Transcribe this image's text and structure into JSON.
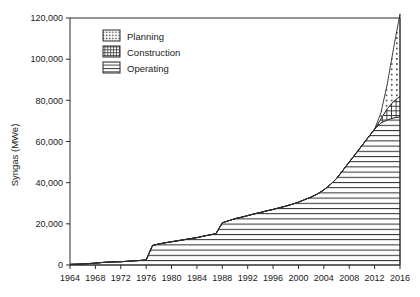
{
  "chart_data": {
    "type": "area",
    "title": "",
    "xlabel": "",
    "ylabel": "Syngas (MWe)",
    "xlim": [
      1964,
      2016
    ],
    "ylim": [
      0,
      120000
    ],
    "grid": false,
    "legend_position": "top-left",
    "y_ticks": [
      0,
      20000,
      40000,
      60000,
      80000,
      100000,
      120000
    ],
    "y_tick_labels": [
      "0",
      "20,000",
      "40,000",
      "60,000",
      "80,000",
      "100,000",
      "120,000"
    ],
    "x_ticks": [
      1964,
      1968,
      1972,
      1976,
      1980,
      1984,
      1988,
      1992,
      1996,
      2000,
      2004,
      2008,
      2012,
      2016
    ],
    "x_tick_labels": [
      "1964",
      "1968",
      "1972",
      "1976",
      "1980",
      "1984",
      "1988",
      "1992",
      "1996",
      "2000",
      "2004",
      "2008",
      "2012",
      "2016"
    ],
    "legend": [
      {
        "name": "Planning",
        "pattern": "dots"
      },
      {
        "name": "Construction",
        "pattern": "grid"
      },
      {
        "name": "Operating",
        "pattern": "horizontal-lines"
      }
    ],
    "x": [
      1964,
      1965,
      1966,
      1967,
      1968,
      1969,
      1970,
      1971,
      1972,
      1973,
      1974,
      1975,
      1976,
      1977,
      1978,
      1979,
      1980,
      1981,
      1982,
      1983,
      1984,
      1985,
      1986,
      1987,
      1988,
      1989,
      1990,
      1991,
      1992,
      1993,
      1994,
      1995,
      1996,
      1997,
      1998,
      1999,
      2000,
      2001,
      2002,
      2003,
      2004,
      2005,
      2006,
      2007,
      2008,
      2009,
      2010,
      2011,
      2012,
      2013,
      2014,
      2015,
      2016
    ],
    "series": [
      {
        "name": "Operating",
        "pattern": "horizontal-lines",
        "values": [
          300,
          400,
          500,
          700,
          900,
          1200,
          1400,
          1500,
          1600,
          1800,
          2000,
          2200,
          2400,
          9500,
          10200,
          10800,
          11300,
          11800,
          12300,
          12800,
          13300,
          14000,
          14600,
          15200,
          20500,
          21500,
          22500,
          23200,
          24000,
          24800,
          25500,
          26300,
          27000,
          27800,
          28600,
          29500,
          30500,
          31800,
          33000,
          34500,
          36500,
          39000,
          42000,
          46000,
          50000,
          54000,
          58000,
          62000,
          66000,
          69000,
          70500,
          71500,
          72000
        ]
      },
      {
        "name": "Construction",
        "pattern": "grid",
        "values": [
          0,
          0,
          0,
          0,
          0,
          0,
          0,
          0,
          0,
          0,
          0,
          0,
          0,
          0,
          0,
          0,
          0,
          0,
          0,
          0,
          0,
          0,
          0,
          0,
          0,
          0,
          0,
          0,
          0,
          0,
          0,
          0,
          0,
          0,
          0,
          0,
          0,
          0,
          0,
          0,
          0,
          0,
          0,
          0,
          0,
          0,
          0,
          0,
          0,
          2000,
          5500,
          8000,
          10000
        ]
      },
      {
        "name": "Planning",
        "pattern": "dots",
        "values": [
          0,
          0,
          0,
          0,
          0,
          0,
          0,
          0,
          0,
          0,
          0,
          0,
          0,
          0,
          0,
          0,
          0,
          0,
          0,
          0,
          0,
          0,
          0,
          0,
          0,
          0,
          0,
          0,
          0,
          0,
          0,
          0,
          0,
          0,
          0,
          0,
          0,
          0,
          0,
          0,
          0,
          0,
          0,
          0,
          0,
          0,
          0,
          0,
          0,
          3000,
          12000,
          26000,
          40000
        ]
      }
    ],
    "totals_note": "",
    "peak_total": 122000
  }
}
